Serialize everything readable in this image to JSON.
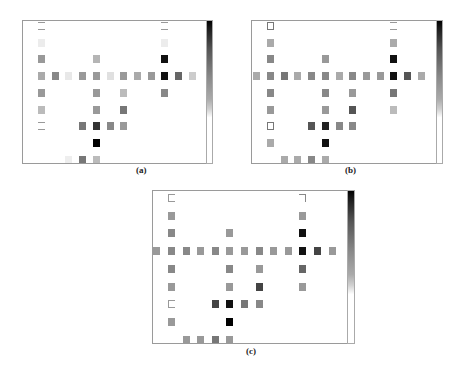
{
  "figure": {
    "panels": [
      {
        "id": "a",
        "label": "(a)",
        "frame": {
          "x": 22,
          "y": 20,
          "w": 191,
          "h": 144
        },
        "colorbar": {
          "x": 206,
          "y": 20,
          "w": 7,
          "h": 144
        },
        "label_pos": {
          "x": 136,
          "y": 165
        },
        "col0_offset": 15,
        "col_spacing": 13.7,
        "row0_offset": 1,
        "row_spacing": 16.7,
        "cells": [
          {
            "r": 0,
            "c": 0,
            "style": "outline-light"
          },
          {
            "r": 0,
            "c": 9,
            "style": "outline-light"
          },
          {
            "r": 1,
            "c": 0,
            "color": "#ececec"
          },
          {
            "r": 1,
            "c": 9,
            "color": "#ececec"
          },
          {
            "r": 2,
            "c": 0,
            "color": "#999999"
          },
          {
            "r": 2,
            "c": 4,
            "color": "#b5b5b5"
          },
          {
            "r": 2,
            "c": 9,
            "color": "#111111"
          },
          {
            "r": 3,
            "c": 0,
            "color": "#aaaaaa"
          },
          {
            "r": 3,
            "c": 1,
            "color": "#888888"
          },
          {
            "r": 3,
            "c": 2,
            "color": "#e8e8e8"
          },
          {
            "r": 3,
            "c": 3,
            "color": "#999999"
          },
          {
            "r": 3,
            "c": 4,
            "color": "#999999"
          },
          {
            "r": 3,
            "c": 5,
            "color": "#e0e0e0"
          },
          {
            "r": 3,
            "c": 6,
            "color": "#999999"
          },
          {
            "r": 3,
            "c": 7,
            "color": "#aaaaaa"
          },
          {
            "r": 3,
            "c": 8,
            "color": "#999999"
          },
          {
            "r": 3,
            "c": 9,
            "color": "#111111"
          },
          {
            "r": 3,
            "c": 10,
            "color": "#666666"
          },
          {
            "r": 3,
            "c": 11,
            "color": "#cccccc"
          },
          {
            "r": 4,
            "c": 0,
            "color": "#999999"
          },
          {
            "r": 4,
            "c": 4,
            "color": "#999999"
          },
          {
            "r": 4,
            "c": 6,
            "color": "#bbbbbb"
          },
          {
            "r": 4,
            "c": 9,
            "color": "#888888"
          },
          {
            "r": 5,
            "c": 0,
            "color": "#bbbbbb"
          },
          {
            "r": 5,
            "c": 4,
            "color": "#999999"
          },
          {
            "r": 5,
            "c": 6,
            "color": "#777777"
          },
          {
            "r": 6,
            "c": 0,
            "style": "outline-light"
          },
          {
            "r": 6,
            "c": 3,
            "color": "#777777"
          },
          {
            "r": 6,
            "c": 4,
            "color": "#333333"
          },
          {
            "r": 6,
            "c": 5,
            "color": "#888888"
          },
          {
            "r": 6,
            "c": 6,
            "color": "#999999"
          },
          {
            "r": 7,
            "c": 4,
            "color": "#000000"
          },
          {
            "r": 8,
            "c": 2,
            "color": "#eeeeee"
          },
          {
            "r": 8,
            "c": 3,
            "color": "#777777"
          },
          {
            "r": 8,
            "c": 4,
            "color": "#bbbbbb"
          }
        ]
      },
      {
        "id": "b",
        "label": "(b)",
        "frame": {
          "x": 251,
          "y": 20,
          "w": 192,
          "h": 144
        },
        "colorbar": {
          "x": 436,
          "y": 20,
          "w": 7,
          "h": 144
        },
        "label_pos": {
          "x": 345,
          "y": 165
        },
        "col0_offset": 15,
        "col_spacing": 13.7,
        "row0_offset": 1,
        "row_spacing": 16.7,
        "cells": [
          {
            "r": 0,
            "c": 0,
            "style": "outline"
          },
          {
            "r": 0,
            "c": 9,
            "style": "outline-light"
          },
          {
            "r": 1,
            "c": 0,
            "color": "#aaaaaa"
          },
          {
            "r": 1,
            "c": 9,
            "color": "#aaaaaa"
          },
          {
            "r": 2,
            "c": 0,
            "color": "#888888"
          },
          {
            "r": 2,
            "c": 4,
            "color": "#999999"
          },
          {
            "r": 2,
            "c": 9,
            "color": "#111111"
          },
          {
            "r": 3,
            "c": -1,
            "color": "#aaaaaa"
          },
          {
            "r": 3,
            "c": 0,
            "color": "#888888"
          },
          {
            "r": 3,
            "c": 1,
            "color": "#777777"
          },
          {
            "r": 3,
            "c": 2,
            "color": "#aaaaaa"
          },
          {
            "r": 3,
            "c": 3,
            "color": "#888888"
          },
          {
            "r": 3,
            "c": 4,
            "color": "#888888"
          },
          {
            "r": 3,
            "c": 5,
            "color": "#aaaaaa"
          },
          {
            "r": 3,
            "c": 6,
            "color": "#888888"
          },
          {
            "r": 3,
            "c": 7,
            "color": "#999999"
          },
          {
            "r": 3,
            "c": 8,
            "color": "#999999"
          },
          {
            "r": 3,
            "c": 9,
            "color": "#111111"
          },
          {
            "r": 3,
            "c": 10,
            "color": "#555555"
          },
          {
            "r": 3,
            "c": 11,
            "color": "#aaaaaa"
          },
          {
            "r": 4,
            "c": 0,
            "color": "#888888"
          },
          {
            "r": 4,
            "c": 4,
            "color": "#888888"
          },
          {
            "r": 4,
            "c": 6,
            "color": "#999999"
          },
          {
            "r": 4,
            "c": 9,
            "color": "#777777"
          },
          {
            "r": 5,
            "c": 0,
            "color": "#999999"
          },
          {
            "r": 5,
            "c": 4,
            "color": "#999999"
          },
          {
            "r": 5,
            "c": 6,
            "color": "#555555"
          },
          {
            "r": 5,
            "c": 9,
            "color": "#bbbbbb"
          },
          {
            "r": 6,
            "c": 0,
            "style": "outline"
          },
          {
            "r": 6,
            "c": 3,
            "color": "#555555"
          },
          {
            "r": 6,
            "c": 4,
            "color": "#222222"
          },
          {
            "r": 6,
            "c": 5,
            "color": "#888888"
          },
          {
            "r": 6,
            "c": 6,
            "color": "#888888"
          },
          {
            "r": 7,
            "c": 0,
            "color": "#aaaaaa"
          },
          {
            "r": 7,
            "c": 4,
            "color": "#111111"
          },
          {
            "r": 8,
            "c": 1,
            "color": "#aaaaaa"
          },
          {
            "r": 8,
            "c": 2,
            "color": "#aaaaaa"
          },
          {
            "r": 8,
            "c": 3,
            "color": "#888888"
          },
          {
            "r": 8,
            "c": 4,
            "color": "#aaaaaa"
          }
        ]
      },
      {
        "id": "c",
        "label": "(c)",
        "frame": {
          "x": 152,
          "y": 190,
          "w": 203,
          "h": 154
        },
        "colorbar": {
          "x": 347,
          "y": 190,
          "w": 8,
          "h": 154
        },
        "label_pos": {
          "x": 246,
          "y": 346
        },
        "col0_offset": 15,
        "col_spacing": 14.6,
        "row0_offset": 3,
        "row_spacing": 17.7,
        "cells": [
          {
            "r": 0,
            "c": 0,
            "style": "bracket-left"
          },
          {
            "r": 0,
            "c": 9,
            "style": "bracket-right"
          },
          {
            "r": 1,
            "c": 0,
            "color": "#999999"
          },
          {
            "r": 1,
            "c": 9,
            "color": "#999999"
          },
          {
            "r": 2,
            "c": 0,
            "color": "#888888"
          },
          {
            "r": 2,
            "c": 4,
            "color": "#999999"
          },
          {
            "r": 2,
            "c": 9,
            "color": "#111111"
          },
          {
            "r": 3,
            "c": -1,
            "color": "#999999"
          },
          {
            "r": 3,
            "c": 0,
            "color": "#888888"
          },
          {
            "r": 3,
            "c": 1,
            "color": "#888888"
          },
          {
            "r": 3,
            "c": 2,
            "color": "#999999"
          },
          {
            "r": 3,
            "c": 3,
            "color": "#888888"
          },
          {
            "r": 3,
            "c": 4,
            "color": "#999999"
          },
          {
            "r": 3,
            "c": 5,
            "color": "#999999"
          },
          {
            "r": 3,
            "c": 6,
            "color": "#888888"
          },
          {
            "r": 3,
            "c": 7,
            "color": "#999999"
          },
          {
            "r": 3,
            "c": 8,
            "color": "#999999"
          },
          {
            "r": 3,
            "c": 9,
            "color": "#111111"
          },
          {
            "r": 3,
            "c": 10,
            "color": "#444444"
          },
          {
            "r": 3,
            "c": 11,
            "color": "#999999"
          },
          {
            "r": 4,
            "c": 0,
            "color": "#888888"
          },
          {
            "r": 4,
            "c": 4,
            "color": "#888888"
          },
          {
            "r": 4,
            "c": 6,
            "color": "#999999"
          },
          {
            "r": 4,
            "c": 9,
            "color": "#666666"
          },
          {
            "r": 5,
            "c": 0,
            "color": "#999999"
          },
          {
            "r": 5,
            "c": 4,
            "color": "#999999"
          },
          {
            "r": 5,
            "c": 6,
            "color": "#444444"
          },
          {
            "r": 5,
            "c": 9,
            "color": "#999999"
          },
          {
            "r": 6,
            "c": 0,
            "style": "bracket-left"
          },
          {
            "r": 6,
            "c": 3,
            "color": "#444444"
          },
          {
            "r": 6,
            "c": 4,
            "color": "#111111"
          },
          {
            "r": 6,
            "c": 5,
            "color": "#777777"
          },
          {
            "r": 6,
            "c": 6,
            "color": "#888888"
          },
          {
            "r": 7,
            "c": 0,
            "color": "#999999"
          },
          {
            "r": 7,
            "c": 4,
            "color": "#000000"
          },
          {
            "r": 8,
            "c": 1,
            "color": "#999999"
          },
          {
            "r": 8,
            "c": 2,
            "color": "#999999"
          },
          {
            "r": 8,
            "c": 3,
            "color": "#777777"
          },
          {
            "r": 8,
            "c": 4,
            "color": "#999999"
          }
        ]
      }
    ]
  }
}
